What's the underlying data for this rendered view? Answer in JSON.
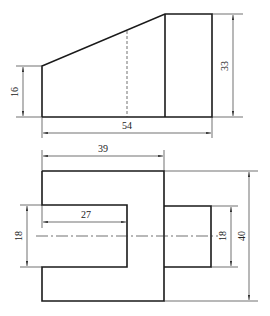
{
  "drawing": {
    "title": "",
    "views": {
      "top_view": {
        "dimensions": {
          "left_height": "16",
          "right_height": "33",
          "overall_length": "54"
        }
      },
      "front_view": {
        "dimensions": {
          "upper_width": "39",
          "slot_depth": "27",
          "slot_height": "18",
          "boss_height": "18",
          "overall_height": "40"
        }
      }
    }
  }
}
